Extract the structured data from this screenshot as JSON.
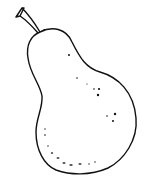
{
  "image": {
    "subject": "pear line drawing",
    "colors": {
      "stroke": "#111111",
      "fill": "#ffffff"
    }
  }
}
